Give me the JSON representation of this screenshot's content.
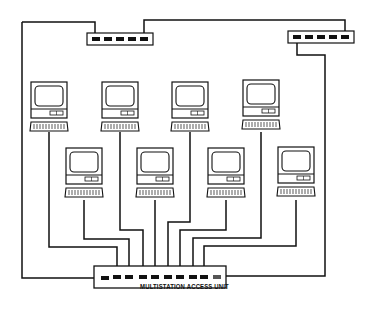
{
  "diagram": {
    "type": "token-ring network topology",
    "mau_label": "MULTISTATION ACCESS UNIT",
    "components": {
      "top_hubs": 2,
      "workstations": 8,
      "access_unit_ports": 10
    },
    "colors": {
      "line": "#111111",
      "background": "#ffffff"
    }
  }
}
